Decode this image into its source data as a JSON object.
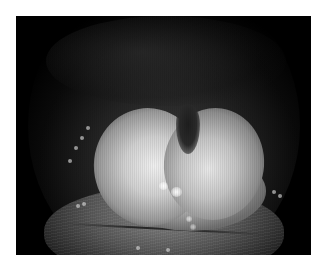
{
  "image": {
    "subject": "endoscopic view of epiglottis",
    "color_mode": "grayscale",
    "colors": {
      "background": "#ffffff",
      "frame": "#000000",
      "tissue_highlight": "#f0f0f0",
      "tissue_mid": "#9a9a9a",
      "caption_text": "#8a8a8a"
    }
  },
  "caption": {
    "text": ""
  }
}
